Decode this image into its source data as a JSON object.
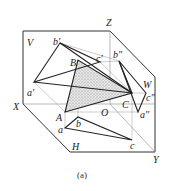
{
  "diagram": {
    "caption": "(a)",
    "planes": {
      "V": "V",
      "H": "H",
      "W": "W"
    },
    "axes": {
      "X": "X",
      "Y": "Y",
      "Z": "Z",
      "O": "O"
    },
    "space_points": {
      "A": "A",
      "B": "B",
      "C": "C"
    },
    "front_projections": {
      "a": "a'",
      "b": "b'",
      "c": "c'"
    },
    "top_projections": {
      "a": "a",
      "b": "b",
      "c": "c"
    },
    "side_projections": {
      "a": "a\"",
      "b": "b\"",
      "c": "c\""
    }
  }
}
